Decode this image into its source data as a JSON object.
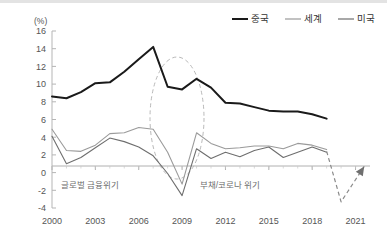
{
  "chart_data": {
    "type": "line",
    "title": "",
    "unit_label": "(%)",
    "xlabel": "",
    "ylabel": "",
    "ylim": [
      -4,
      16
    ],
    "ytick_step": 2,
    "yticks": [
      "16",
      "14",
      "12",
      "10",
      "8",
      "6",
      "4",
      "2",
      "0",
      "-2",
      "-4"
    ],
    "xlim": [
      2000,
      2022
    ],
    "xticks": [
      "2000",
      "2003",
      "2006",
      "2009",
      "2012",
      "2015",
      "2018",
      "2021"
    ],
    "grid": false,
    "legend_position": "top-right",
    "x": [
      2000,
      2001,
      2002,
      2003,
      2004,
      2005,
      2006,
      2007,
      2008,
      2009,
      2010,
      2011,
      2012,
      2013,
      2014,
      2015,
      2016,
      2017,
      2018,
      2019
    ],
    "series": [
      {
        "name": "중국",
        "color": "#1a1a1a",
        "width": 2.0,
        "values": [
          8.6,
          8.4,
          9.1,
          10.1,
          10.2,
          11.4,
          12.8,
          14.2,
          9.7,
          9.4,
          10.6,
          9.6,
          7.9,
          7.8,
          7.4,
          7.0,
          6.9,
          6.9,
          6.6,
          6.1
        ]
      },
      {
        "name": "세계",
        "color": "#9a9a9a",
        "width": 1.1,
        "values": [
          4.9,
          2.5,
          2.4,
          3.1,
          4.4,
          4.5,
          5.1,
          4.9,
          2.3,
          -1.3,
          4.5,
          3.3,
          2.7,
          2.8,
          3.0,
          3.0,
          2.7,
          3.3,
          3.1,
          2.6
        ]
      },
      {
        "name": "미국",
        "color": "#6e6e6e",
        "width": 1.1,
        "values": [
          4.1,
          1.0,
          1.7,
          2.8,
          3.9,
          3.5,
          2.9,
          1.9,
          -0.1,
          -2.6,
          2.7,
          1.6,
          2.3,
          1.8,
          2.5,
          2.9,
          1.7,
          2.3,
          2.9,
          2.3
        ]
      }
    ],
    "forecast": {
      "name": "코로나 급락·회복",
      "color": "#8a8a8a",
      "style": "dashed",
      "arrow": true,
      "points": [
        {
          "x": 2019,
          "y": 2.4
        },
        {
          "x": 2020,
          "y": -3.3
        },
        {
          "x": 2021.6,
          "y": 0.7
        }
      ]
    },
    "annotations": [
      {
        "id": "global-financial-crisis",
        "text": "글로벌 금융위기",
        "type": "label",
        "x": 90,
        "y": 188
      },
      {
        "id": "debt-corona-crisis",
        "text": "부채/코로나 위기",
        "type": "label",
        "x": 230,
        "y": 188
      },
      {
        "id": "crisis-ellipse",
        "type": "ellipse",
        "cx": 177,
        "cy": 118,
        "rx": 27,
        "ry": 61,
        "color": "#b9b9b9",
        "style": "dashed"
      }
    ]
  },
  "legend": {
    "items": [
      {
        "label": "중국",
        "color": "#1a1a1a"
      },
      {
        "label": "세계",
        "color": "#9a9a9a"
      },
      {
        "label": "미국",
        "color": "#6e6e6e"
      }
    ]
  }
}
